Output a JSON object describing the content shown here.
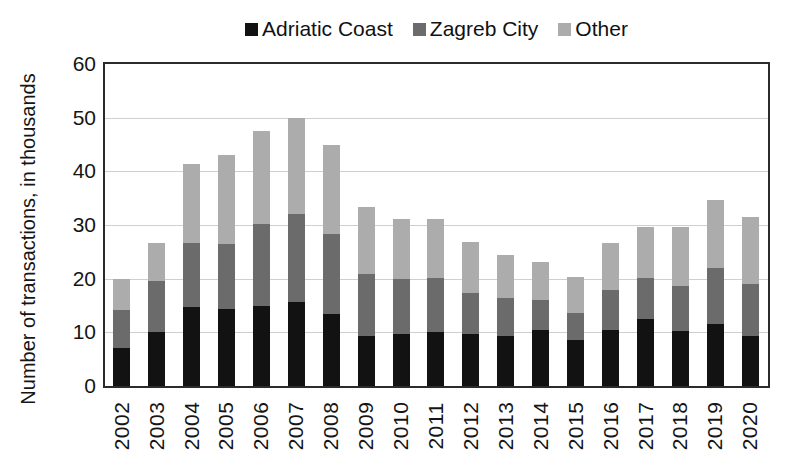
{
  "figure": {
    "background": "#ffffff",
    "axis_color": "#2b2b2b",
    "grid_color": "#cfcfcf",
    "text_color": "#151515"
  },
  "chart_data": {
    "type": "bar",
    "stacked": true,
    "orientation": "vertical",
    "title": "",
    "xlabel": "",
    "ylabel": "Number of transactions, in thousands",
    "ylim": [
      0,
      60
    ],
    "yticks": [
      0,
      10,
      20,
      30,
      40,
      50,
      60
    ],
    "grid": "horizontal",
    "frame": true,
    "legend_position": "top-center",
    "categories": [
      "2002",
      "2003",
      "2004",
      "2005",
      "2006",
      "2007",
      "2008",
      "2009",
      "2010",
      "2011",
      "2012",
      "2013",
      "2014",
      "2015",
      "2016",
      "2017",
      "2018",
      "2019",
      "2020"
    ],
    "series": [
      {
        "name": "Adriatic Coast",
        "color": "#121212",
        "values": [
          7.0,
          10.0,
          14.8,
          14.3,
          15.0,
          15.6,
          13.4,
          9.4,
          9.6,
          10.1,
          9.6,
          9.3,
          10.4,
          8.6,
          10.5,
          12.5,
          10.2,
          11.5,
          9.3
        ]
      },
      {
        "name": "Zagreb City",
        "color": "#6b6b6b",
        "values": [
          7.2,
          9.5,
          11.8,
          12.2,
          15.2,
          16.5,
          15.0,
          11.4,
          10.4,
          10.0,
          7.7,
          7.1,
          5.6,
          5.1,
          7.3,
          7.7,
          8.4,
          10.5,
          9.8
        ]
      },
      {
        "name": "Other",
        "color": "#acacac",
        "values": [
          5.8,
          7.2,
          14.7,
          16.5,
          17.3,
          17.8,
          16.6,
          12.5,
          11.1,
          11.0,
          9.5,
          8.0,
          7.2,
          6.6,
          8.9,
          9.5,
          11.1,
          12.6,
          12.4
        ]
      }
    ],
    "stack_totals": [
      20.0,
      26.7,
      41.3,
      43.0,
      47.5,
      49.9,
      45.0,
      33.3,
      31.1,
      31.1,
      26.8,
      24.4,
      23.2,
      20.3,
      26.7,
      29.7,
      29.7,
      34.6,
      31.5
    ]
  }
}
